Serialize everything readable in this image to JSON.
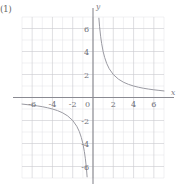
{
  "figure": {
    "problem_label": "(1)",
    "x_axis_name": "x",
    "y_axis_name": "y",
    "origin_label": "0"
  },
  "chart_data": {
    "type": "line",
    "title": "",
    "subtitle": "",
    "xlabel": "x",
    "ylabel": "y",
    "equation": "y = 4/x",
    "k": 4,
    "grid": true,
    "grid_major_step": 2,
    "grid_minor_step": 1,
    "legend": "none",
    "xlim": [
      -7,
      7
    ],
    "ylim": [
      -7,
      7
    ],
    "xticks": [
      -6,
      -4,
      -2,
      0,
      2,
      4,
      6
    ],
    "xtick_labels": [
      "-6",
      "-4",
      "-2",
      "0",
      "2",
      "4",
      "6"
    ],
    "yticks": [
      -6,
      -4,
      -2,
      2,
      4,
      6
    ],
    "ytick_labels": [
      "-6",
      "-4",
      "-2",
      "2",
      "4",
      "6"
    ],
    "series": [
      {
        "name": "branch-quadrant-I",
        "x": [
          0.58,
          0.65,
          0.75,
          0.85,
          1.0,
          1.15,
          1.35,
          1.6,
          2.0,
          2.5,
          3.0,
          3.5,
          4.0,
          4.5,
          5.0,
          5.5,
          6.0,
          6.5,
          7.0
        ],
        "y": [
          6.9,
          6.15,
          5.33,
          4.71,
          4.0,
          3.48,
          2.96,
          2.5,
          2.0,
          1.6,
          1.33,
          1.14,
          1.0,
          0.89,
          0.8,
          0.73,
          0.67,
          0.62,
          0.57
        ]
      },
      {
        "name": "branch-quadrant-III",
        "x": [
          -7.0,
          -6.5,
          -6.0,
          -5.5,
          -5.0,
          -4.5,
          -4.0,
          -3.5,
          -3.0,
          -2.5,
          -2.0,
          -1.6,
          -1.35,
          -1.15,
          -1.0,
          -0.85,
          -0.75,
          -0.65,
          -0.58
        ],
        "y": [
          -0.57,
          -0.62,
          -0.67,
          -0.73,
          -0.8,
          -0.89,
          -1.0,
          -1.14,
          -1.33,
          -1.6,
          -2.0,
          -2.5,
          -2.96,
          -3.48,
          -4.0,
          -4.71,
          -5.33,
          -6.15,
          -6.9
        ]
      }
    ],
    "colors": {
      "curve": "#9a9aa2",
      "axis": "#8a8a92",
      "grid_major": "#c9c9cf",
      "grid_minor": "#e3e3e6",
      "text": "#6f6f77",
      "background": "#ffffff"
    }
  }
}
